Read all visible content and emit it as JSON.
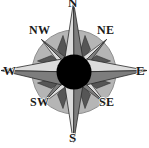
{
  "figure": {
    "name": "compass-rose",
    "width": 149,
    "height": 148,
    "background_color": "#ffffff"
  },
  "compass": {
    "center": {
      "x": 74,
      "y": 72
    },
    "disc_radius": 42,
    "hub_radius": 17,
    "colors": {
      "disc_fill": "#b5b5b5",
      "disc_stroke": "#8f8f8f",
      "point_light": "#dcdcdc",
      "point_dark": "#7d7d7d",
      "secondary_dark": "#565656",
      "hub_fill": "#000000",
      "outline": "#2a2a2a",
      "label_color": "#1a1a1a",
      "background": "#ffffff"
    },
    "labels": {
      "north": "N",
      "northeast": "NE",
      "east": "E",
      "southeast": "SE",
      "south": "S",
      "southwest": "SW",
      "west": "W",
      "northwest": "NW"
    },
    "points": [
      {
        "name": "north",
        "abbr": "N",
        "bearing_deg": 0,
        "order": "cardinal"
      },
      {
        "name": "northeast",
        "abbr": "NE",
        "bearing_deg": 45,
        "order": "intercardinal"
      },
      {
        "name": "east",
        "abbr": "E",
        "bearing_deg": 90,
        "order": "cardinal"
      },
      {
        "name": "southeast",
        "abbr": "SE",
        "bearing_deg": 135,
        "order": "intercardinal"
      },
      {
        "name": "south",
        "abbr": "S",
        "bearing_deg": 180,
        "order": "cardinal"
      },
      {
        "name": "southwest",
        "abbr": "SW",
        "bearing_deg": 225,
        "order": "intercardinal"
      },
      {
        "name": "west",
        "abbr": "W",
        "bearing_deg": 270,
        "order": "cardinal"
      },
      {
        "name": "northwest",
        "abbr": "NW",
        "bearing_deg": 315,
        "order": "intercardinal"
      }
    ]
  }
}
